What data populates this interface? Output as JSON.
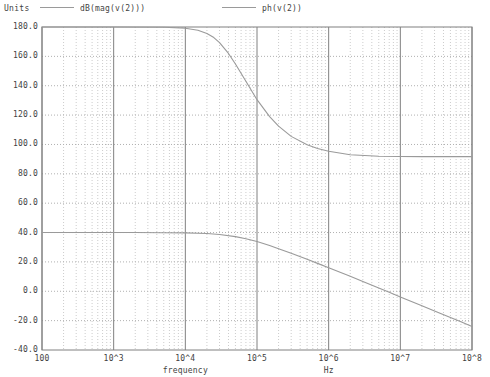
{
  "legend": {
    "units_label": "Units",
    "entries": [
      {
        "label": "dB(mag(v(2)))",
        "color": "#9a9a9a"
      },
      {
        "label": "ph(v(2))",
        "color": "#9a9a9a"
      }
    ]
  },
  "axis_captions": {
    "x_left": "frequency",
    "x_right": "Hz"
  },
  "chart_data": {
    "type": "line",
    "title": "",
    "subtitle": "",
    "xlabel": "frequency",
    "xlabel_right": "Hz",
    "ylabel": "Units",
    "x_scale": "log",
    "y_scale": "linear",
    "grid": true,
    "minor_grid": true,
    "legend_position": "top",
    "xlim": [
      100,
      100000000
    ],
    "ylim": [
      -40,
      180
    ],
    "y_ticks": [
      -40,
      -20,
      0,
      20,
      40,
      60,
      80,
      100,
      120,
      140,
      160,
      180
    ],
    "y_tick_labels": [
      "-40.0",
      "-20.0",
      "0.0",
      "20.0",
      "40.0",
      "60.0",
      "80.0",
      "100.0",
      "120.0",
      "140.0",
      "160.0",
      "180.0"
    ],
    "x_ticks": [
      100,
      1000,
      10000,
      100000,
      1000000,
      10000000,
      100000000
    ],
    "x_tick_labels": [
      "100",
      "10^3",
      "10^4",
      "10^5",
      "10^6",
      "10^7",
      "10^8"
    ],
    "series": [
      {
        "name": "dB(mag(v(2)))",
        "color": "#9a9a9a",
        "x": [
          100,
          200,
          500,
          1000,
          2000,
          5000,
          10000,
          20000,
          30000,
          50000,
          70000,
          100000,
          150000,
          200000,
          300000,
          500000,
          700000,
          1000000,
          2000000,
          3000000,
          5000000,
          7000000,
          10000000,
          20000000,
          30000000,
          50000000,
          70000000,
          100000000
        ],
        "y": [
          40.0,
          40.0,
          40.0,
          40.0,
          40.0,
          39.9,
          39.8,
          39.3,
          38.7,
          37.2,
          35.8,
          33.9,
          31.2,
          29.0,
          25.9,
          21.8,
          19.0,
          16.0,
          10.2,
          6.7,
          2.3,
          -0.6,
          -3.9,
          -9.9,
          -13.4,
          -17.9,
          -20.8,
          -24.0
        ]
      },
      {
        "name": "ph(v(2))",
        "color": "#9a9a9a",
        "x": [
          100,
          1000,
          5000,
          10000,
          15000,
          20000,
          25000,
          30000,
          40000,
          50000,
          70000,
          100000,
          150000,
          200000,
          300000,
          500000,
          700000,
          1000000,
          2000000,
          5000000,
          10000000,
          20000000,
          50000000,
          100000000
        ],
        "y": [
          180.0,
          180.0,
          179.8,
          179.2,
          177.8,
          175.6,
          172.8,
          169.4,
          162.0,
          154.8,
          143.0,
          130.5,
          119.0,
          112.5,
          105.5,
          99.8,
          97.3,
          95.4,
          93.0,
          92.0,
          91.8,
          91.7,
          91.7,
          91.7
        ]
      }
    ],
    "annotations": []
  },
  "geometry": {
    "plot_left": 42,
    "plot_right": 472,
    "plot_top": 27,
    "plot_bottom": 350
  },
  "colors": {
    "frame": "#808080",
    "major_grid": "#b0b0b0",
    "minor_grid": "#cccccc",
    "curve": "#9a9a9a",
    "text": "#3f3f3f",
    "background": "#ffffff"
  }
}
